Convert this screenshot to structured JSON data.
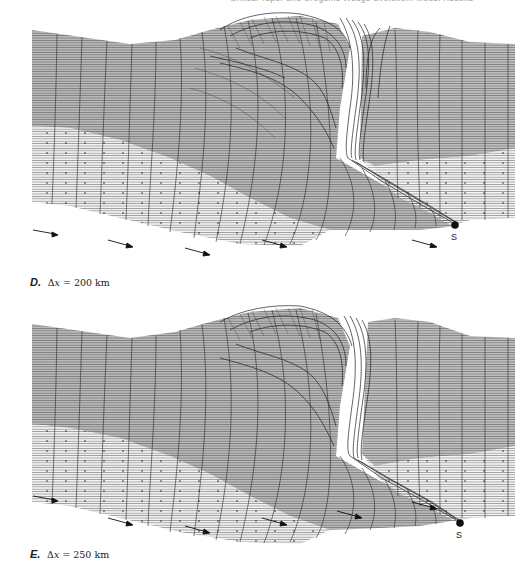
{
  "header": {
    "running_head": "Critical Taper and Orogenic Wedge Evolution: Model Results"
  },
  "colors": {
    "upper_layer": "#b9b9b9",
    "lower_layer": "#ececec",
    "grid_line": "#2a2a2a",
    "singularity": "#111111"
  },
  "panels": [
    {
      "id": "D",
      "letter": "D.",
      "delta_symbol": "Δ",
      "variable": "x",
      "equals": " = ",
      "value": "200",
      "unit": " km",
      "point_label": "S",
      "arrows": 8
    },
    {
      "id": "E",
      "letter": "E.",
      "delta_symbol": "Δ",
      "variable": "x",
      "equals": " = ",
      "value": "250",
      "unit": " km",
      "point_label": "S",
      "arrows": 8
    }
  ]
}
